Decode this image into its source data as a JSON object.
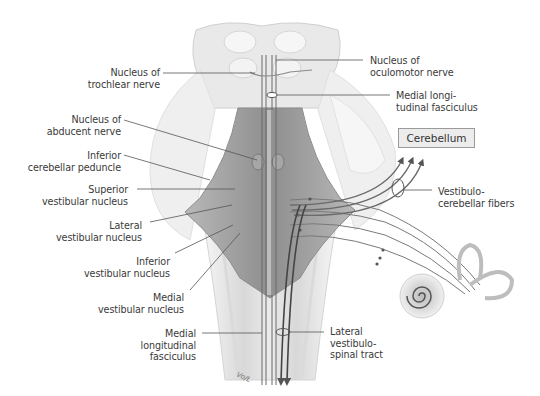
{
  "figure": {
    "signature": "Vo/L"
  },
  "labels_left": [
    {
      "id": "trochlear",
      "text": "Nucleus of\ntrochlear nerve"
    },
    {
      "id": "abducent",
      "text": "Nucleus of\nabducent nerve"
    },
    {
      "id": "inf_peduncle",
      "text": "Inferior\ncerebellar peduncle"
    },
    {
      "id": "sup_vest",
      "text": "Superior\nvestibular nucleus"
    },
    {
      "id": "lat_vest",
      "text": "Lateral\nvestibular nucleus"
    },
    {
      "id": "inf_vest",
      "text": "Inferior\nvestibular nucleus"
    },
    {
      "id": "med_vest",
      "text": "Medial\nvestibular nucleus"
    },
    {
      "id": "mlf_bottom",
      "text": "Medial\nlongitudinal\nfasciculus"
    }
  ],
  "labels_right": [
    {
      "id": "oculomotor",
      "text": "Nucleus of\noculomotor nerve"
    },
    {
      "id": "mlf_top",
      "text": "Medial longi-\ntudinal fasciculus"
    },
    {
      "id": "vestibulocerebellar",
      "text": "Vestibulo-\ncerebellar fibers"
    },
    {
      "id": "lat_vestibulospinal",
      "text": "Lateral\nvestibulo-\nspinal tract"
    }
  ],
  "boxes": {
    "cerebellum": "Cerebellum"
  },
  "colors": {
    "background": "#ffffff",
    "label_text": "#3a3a3a",
    "leader_line": "#555555",
    "brainstem_light": "#e6e6e6",
    "floor_dark": "#9c9c9c",
    "fiber": "#6a6a6a",
    "box_fill": "#ececec"
  }
}
